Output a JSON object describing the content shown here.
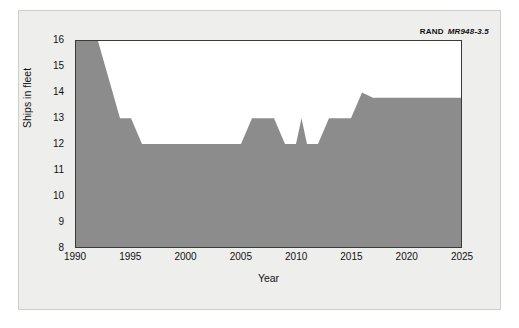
{
  "credit": {
    "org": "RAND",
    "doc_id": "MR948-3.5"
  },
  "chart_data": {
    "type": "area",
    "title": "",
    "xlabel": "Year",
    "ylabel": "Ships in fleet",
    "xlim": [
      1990,
      2025
    ],
    "ylim": [
      8,
      16
    ],
    "xticks": [
      1990,
      1995,
      2000,
      2005,
      2010,
      2015,
      2020,
      2025
    ],
    "xtick_labels": [
      "1990",
      "1995",
      "2000",
      "2005",
      "2010",
      "2015",
      "2020",
      "2025"
    ],
    "yticks": [
      8,
      9,
      10,
      11,
      12,
      13,
      14,
      15,
      16
    ],
    "ytick_labels": [
      "8",
      "9",
      "10",
      "11",
      "12",
      "13",
      "14",
      "15",
      "16"
    ],
    "minor_xtick_interval": 1,
    "grid": false,
    "fill_color": "#8c8c8c",
    "line_color": "#8c8c8c",
    "background_color": "#ffffff",
    "legend": null,
    "series": [
      {
        "name": "Ships in fleet",
        "x": [
          1990,
          1992,
          1994,
          1995,
          1996,
          2005,
          2006,
          2007,
          2008,
          2009,
          2010,
          2010.5,
          2011,
          2012,
          2013,
          2015,
          2016,
          2017,
          2025
        ],
        "values": [
          16,
          16,
          13,
          13,
          12,
          12,
          13,
          13,
          13,
          12,
          12,
          13,
          12,
          12,
          13,
          13,
          14,
          13.8,
          13.8
        ]
      }
    ]
  }
}
